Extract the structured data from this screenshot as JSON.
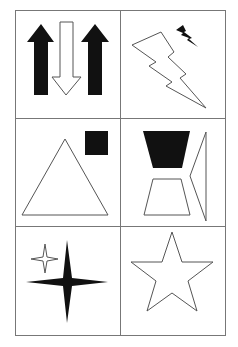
{
  "figure": {
    "rows": 3,
    "cols": 2,
    "colors": {
      "line": "#555555",
      "fill": "#111111",
      "grid": "#777777",
      "background": "#ffffff"
    },
    "cells": [
      {
        "row": 1,
        "col": 1,
        "description": "Two solid up arrows flanking one hollow down arrow",
        "shapes": [
          "arrow-up-filled",
          "arrow-down-outline",
          "arrow-up-filled"
        ]
      },
      {
        "row": 1,
        "col": 2,
        "description": "Large outlined lightning bolt with small filled lightning bolt",
        "shapes": [
          "lightning-outline",
          "lightning-filled"
        ]
      },
      {
        "row": 2,
        "col": 1,
        "description": "Large outlined triangle with small filled square",
        "shapes": [
          "triangle-outline",
          "square-filled"
        ]
      },
      {
        "row": 2,
        "col": 2,
        "description": "Filled trapezoid above outlined trapezoid, with outlined side shape",
        "shapes": [
          "trapezoid-filled",
          "trapezoid-outline",
          "side-wedge-outline"
        ]
      },
      {
        "row": 3,
        "col": 1,
        "description": "Large filled four-point star with small outlined four-point star",
        "shapes": [
          "four-point-star-filled",
          "four-point-star-outline"
        ]
      },
      {
        "row": 3,
        "col": 2,
        "description": "Large outlined five-point star",
        "shapes": [
          "five-point-star-outline"
        ]
      }
    ]
  }
}
